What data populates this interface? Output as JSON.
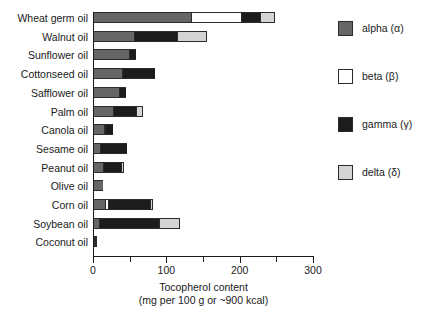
{
  "chart_data": {
    "type": "bar",
    "orientation": "horizontal",
    "stacked": true,
    "title": "",
    "xlabel": "Tocopherol content (mg per 100 g or ~900 kcal)",
    "xlabel_line1": "Tocopherol content",
    "xlabel_line2": "(mg per 100 g or ~900 kcal)",
    "ylabel": "",
    "xlim": [
      0,
      300
    ],
    "xticks": [
      0,
      50,
      100,
      150,
      200,
      250,
      300
    ],
    "xtick_labels": [
      "0",
      "",
      "100",
      "",
      "200",
      "",
      "300"
    ],
    "grid": false,
    "legend_position": "right",
    "categories": [
      "Wheat germ oil",
      "Walnut oil",
      "Sunflower oil",
      "Cottonseed oil",
      "Safflower oil",
      "Palm oil",
      "Canola oil",
      "Sesame oil",
      "Peanut oil",
      "Olive oil",
      "Corn oil",
      "Soybean oil",
      "Coconut oil"
    ],
    "series": [
      {
        "name": "alpha (α)",
        "color": "#666666",
        "values": [
          133,
          56,
          49,
          40,
          35,
          27,
          15,
          10,
          13,
          13,
          16,
          8,
          1
        ]
      },
      {
        "name": "beta (β)",
        "color": "#ffffff",
        "values": [
          69,
          0,
          0,
          0,
          0,
          0,
          2,
          0,
          0,
          0,
          4,
          0,
          0
        ]
      },
      {
        "name": "gamma (γ)",
        "color": "#1c1c1c",
        "values": [
          26,
          59,
          9,
          44,
          10,
          31,
          10,
          37,
          25,
          0,
          58,
          82,
          1
        ]
      },
      {
        "name": "delta (δ)",
        "color": "#d4d4d4",
        "values": [
          20,
          40,
          0,
          0,
          0,
          10,
          0,
          0,
          4,
          0,
          4,
          28,
          1
        ]
      }
    ],
    "totals": [
      248,
      155,
      58,
      84,
      45,
      68,
      27,
      47,
      42,
      13,
      82,
      118,
      3
    ]
  },
  "legend": {
    "items": [
      {
        "label": "alpha (α)",
        "color": "#666666"
      },
      {
        "label": "beta (β)",
        "color": "#ffffff"
      },
      {
        "label": "gamma (γ)",
        "color": "#1c1c1c"
      },
      {
        "label": "delta (δ)",
        "color": "#d4d4d4"
      }
    ]
  }
}
